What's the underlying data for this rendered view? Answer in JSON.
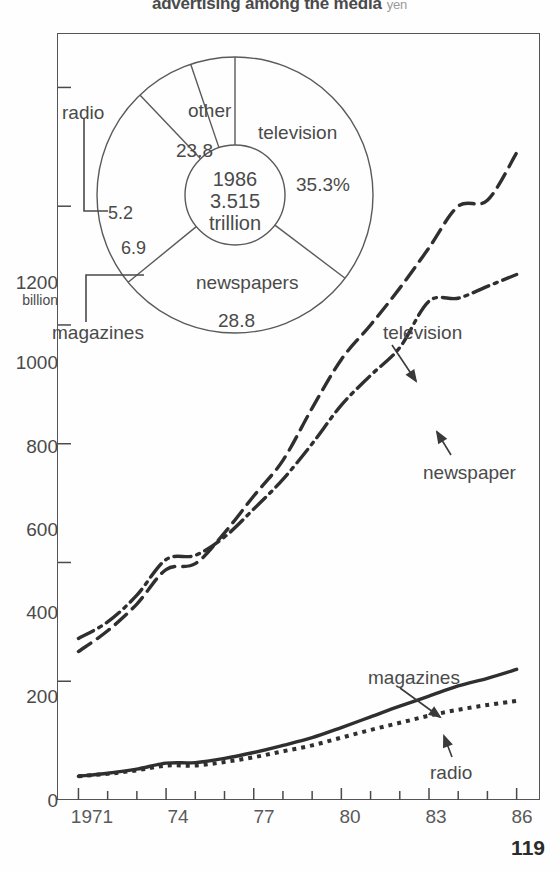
{
  "title": {
    "text": "advertising among the media",
    "unit": "yen"
  },
  "page_number": "119",
  "chart_data": [
    {
      "type": "pie",
      "title": "Share of advertising among the media, 1986",
      "center_label": [
        "1986",
        "3.515",
        "trillion"
      ],
      "unit": "yen",
      "legend_position": "on-slices",
      "slices": [
        {
          "label": "television",
          "value": 35.3,
          "value_text": "35.3%"
        },
        {
          "label": "newspapers",
          "value": 28.8,
          "value_text": "28.8"
        },
        {
          "label": "other",
          "value": 23.8,
          "value_text": "23.8"
        },
        {
          "label": "magazines",
          "value": 6.9,
          "value_text": "6.9"
        },
        {
          "label": "radio",
          "value": 5.2,
          "value_text": "5.2"
        }
      ]
    },
    {
      "type": "line",
      "title": "Advertising expenditure by medium, 1971-1986",
      "xlabel": "",
      "ylabel": "1200 billion",
      "ylabel_unit": "billion yen",
      "grid": false,
      "legend_position": "inline-annotations",
      "x": [
        1971,
        1972,
        1973,
        1974,
        1975,
        1976,
        1977,
        1978,
        1979,
        1980,
        1981,
        1982,
        1983,
        1984,
        1985,
        1986
      ],
      "xtick_labels": [
        "1971",
        "74",
        "77",
        "80",
        "83",
        "86"
      ],
      "xtick_years": [
        1971,
        1974,
        1977,
        1980,
        1983,
        1986
      ],
      "xlim": [
        1970.3,
        1986.8
      ],
      "ytick_labels": [
        "0",
        "200",
        "400",
        "600",
        "800",
        "1000",
        "1200"
      ],
      "ylim": [
        0,
        1290
      ],
      "series": [
        {
          "name": "television",
          "style": "dashed",
          "values": [
            250,
            285,
            330,
            388,
            398,
            450,
            512,
            572,
            660,
            742,
            800,
            862,
            930,
            1000,
            1010,
            1090
          ]
        },
        {
          "name": "newspaper",
          "style": "dash-dot",
          "values": [
            272,
            300,
            345,
            405,
            412,
            443,
            490,
            540,
            600,
            665,
            715,
            762,
            840,
            845,
            865,
            885
          ]
        },
        {
          "name": "magazines",
          "style": "solid",
          "values": [
            40,
            45,
            52,
            62,
            63,
            70,
            80,
            92,
            105,
            122,
            140,
            158,
            175,
            192,
            205,
            220
          ]
        },
        {
          "name": "radio",
          "style": "dotted",
          "values": [
            40,
            44,
            50,
            58,
            58,
            64,
            72,
            82,
            92,
            105,
            118,
            130,
            142,
            152,
            160,
            167
          ]
        }
      ]
    }
  ],
  "y_axis": {
    "ticks": [
      {
        "label": "1200",
        "sub": "billion",
        "value": 1200
      },
      {
        "label": "1000",
        "sub": "",
        "value": 1000
      },
      {
        "label": "800",
        "sub": "",
        "value": 800
      },
      {
        "label": "600",
        "sub": "",
        "value": 600
      },
      {
        "label": "400",
        "sub": "",
        "value": 400
      },
      {
        "label": "200",
        "sub": "",
        "value": 200
      },
      {
        "label": "0",
        "sub": "",
        "value": 0
      }
    ]
  },
  "x_axis": {
    "ticks": [
      {
        "label": "1971",
        "value": 1971
      },
      {
        "label": "74",
        "value": 1974
      },
      {
        "label": "77",
        "value": 1977
      },
      {
        "label": "80",
        "value": 1980
      },
      {
        "label": "83",
        "value": 1983
      },
      {
        "label": "86",
        "value": 1986
      }
    ]
  },
  "pie_labels": {
    "television": "television",
    "television_value": "35.3%",
    "newspapers": "newspapers",
    "newspapers_value": "28.8",
    "other": "other",
    "other_value": "23.8",
    "radio": "radio",
    "radio_value": "5.2",
    "magazines": "magazines",
    "magazines_value": "6.9",
    "center_year": "1986",
    "center_amount": "3.515",
    "center_unit": "trillion"
  },
  "line_labels": {
    "television": "television",
    "newspaper": "newspaper",
    "magazines": "magazines",
    "radio": "radio"
  }
}
